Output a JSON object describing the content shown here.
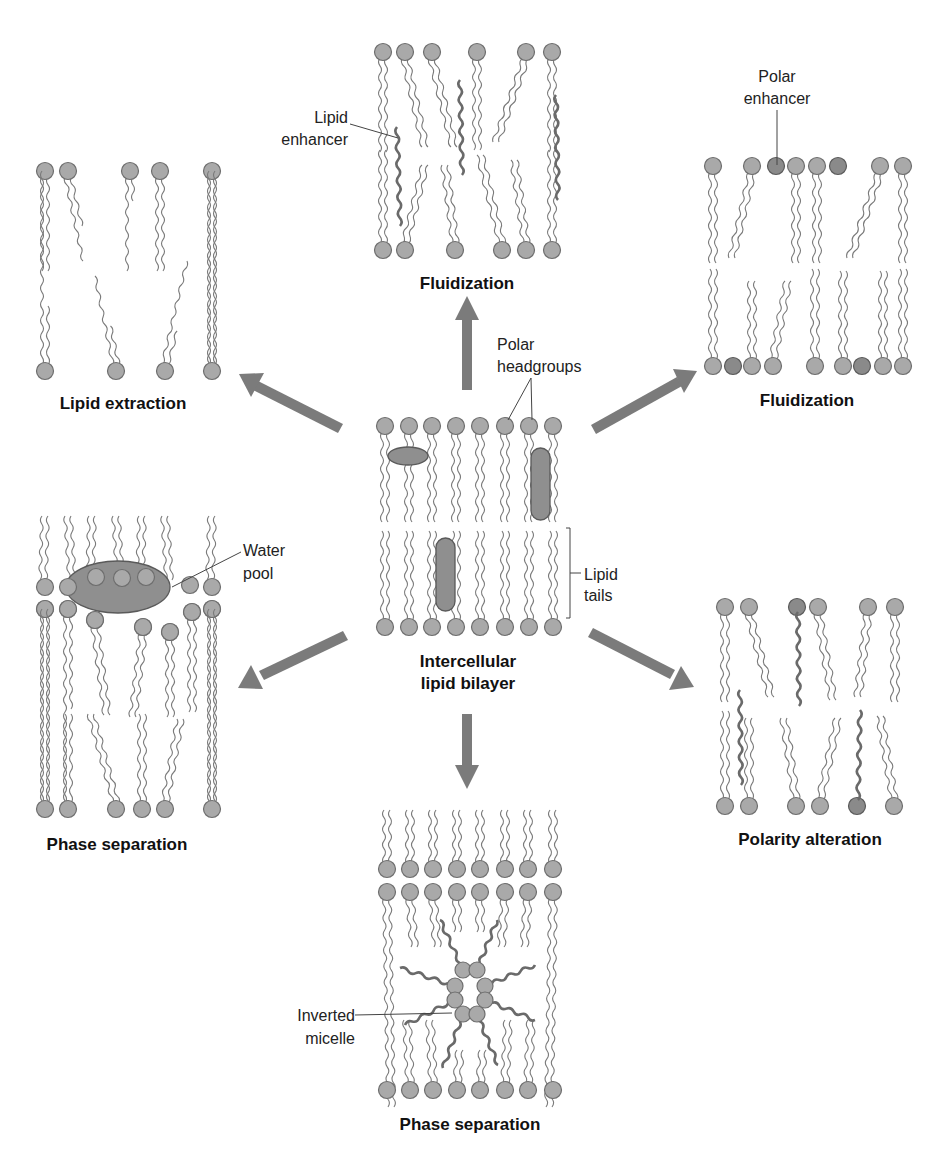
{
  "diagram": {
    "center": {
      "title_line1": "Intercellular",
      "title_line2": "lipid bilayer",
      "labels": {
        "polar_headgroups_line1": "Polar",
        "polar_headgroups_line2": "headgroups",
        "lipid_tails_line1": "Lipid",
        "lipid_tails_line2": "tails"
      }
    },
    "panels": [
      {
        "id": "top",
        "title": "Fluidization",
        "annotation_line1": "Lipid",
        "annotation_line2": "enhancer"
      },
      {
        "id": "top-right",
        "title": "Fluidization",
        "annotation_line1": "Polar",
        "annotation_line2": "enhancer"
      },
      {
        "id": "top-left",
        "title": "Lipid extraction"
      },
      {
        "id": "bottom-left",
        "title": "Phase separation",
        "annotation_line1": "Water",
        "annotation_line2": "pool"
      },
      {
        "id": "bottom-right",
        "title": "Polarity alteration"
      },
      {
        "id": "bottom",
        "title": "Phase separation",
        "annotation_line1": "Inverted",
        "annotation_line2": "micelle"
      }
    ],
    "arrows": [
      {
        "direction": "up",
        "target": "top"
      },
      {
        "direction": "up-right",
        "target": "top-right"
      },
      {
        "direction": "up-left",
        "target": "top-left"
      },
      {
        "direction": "down-left",
        "target": "bottom-left"
      },
      {
        "direction": "down-right",
        "target": "bottom-right"
      },
      {
        "direction": "down",
        "target": "bottom"
      }
    ],
    "colors": {
      "headgroup": "#a9a9a9",
      "enhancer": "#8f8f8f",
      "arrow": "#7b7b7b",
      "text": "#111111"
    }
  }
}
